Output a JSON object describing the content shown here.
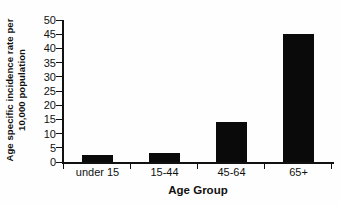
{
  "chart": {
    "ylabel_line1": "Age specific incidence rate per",
    "ylabel_line2": "10,000 population",
    "xlabel": "Age Group"
  },
  "chart_data": {
    "type": "bar",
    "categories": [
      "under 15",
      "15-44",
      "45-64",
      "65+"
    ],
    "values": [
      2.5,
      3,
      14,
      45
    ],
    "title": "",
    "xlabel": "Age Group",
    "ylabel": "Age specific incidence rate per 10,000 population",
    "ylim": [
      0,
      50
    ],
    "ytick_step": 5,
    "yticks": [
      0,
      5,
      10,
      15,
      20,
      25,
      30,
      35,
      40,
      45,
      50
    ],
    "bar_color": "#0a0a0a",
    "axis_color": "#111111",
    "background_color": "#fefefe",
    "grid": false,
    "legend": null
  }
}
